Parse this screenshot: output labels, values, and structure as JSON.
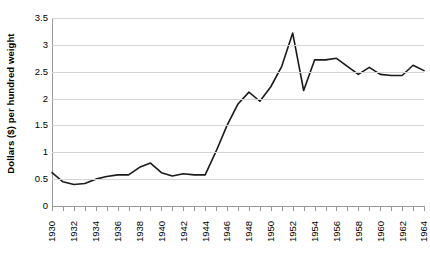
{
  "chart_data": {
    "type": "line",
    "title": "",
    "subtitle": "",
    "xlabel": "",
    "ylabel": "Dollars ($) per hundred weight",
    "ylim": [
      0,
      3.5
    ],
    "xlim": [
      1930,
      1964
    ],
    "y_ticks": [
      0,
      0.5,
      1,
      1.5,
      2,
      2.5,
      3,
      3.5
    ],
    "y_tick_labels": [
      "0",
      "0.5",
      "1",
      "1.5",
      "2",
      "2.5",
      "3",
      "3.5"
    ],
    "x_ticks": [
      1930,
      1932,
      1934,
      1936,
      1938,
      1940,
      1942,
      1944,
      1946,
      1948,
      1950,
      1952,
      1954,
      1956,
      1958,
      1960,
      1962,
      1964
    ],
    "x_tick_labels": [
      "1930",
      "1932",
      "1934",
      "1936",
      "1938",
      "1940",
      "1942",
      "1944",
      "1946",
      "1948",
      "1950",
      "1952",
      "1954",
      "1956",
      "1958",
      "1960",
      "1962",
      "1964"
    ],
    "x_minor_tick_step": 1,
    "grid": "horizontal",
    "legend": "none",
    "line_color": "#1a1a1a",
    "line_width": 1.6,
    "markers": "none",
    "x": [
      1930,
      1931,
      1932,
      1933,
      1934,
      1935,
      1936,
      1937,
      1938,
      1939,
      1940,
      1941,
      1942,
      1943,
      1944,
      1945,
      1946,
      1947,
      1948,
      1949,
      1950,
      1951,
      1952,
      1953,
      1954,
      1955,
      1956,
      1957,
      1958,
      1959,
      1960,
      1961,
      1962,
      1963,
      1964
    ],
    "values": [
      0.62,
      0.45,
      0.4,
      0.42,
      0.5,
      0.55,
      0.58,
      0.58,
      0.72,
      0.8,
      0.62,
      0.56,
      0.6,
      0.58,
      0.58,
      1.02,
      1.5,
      1.9,
      2.12,
      1.95,
      2.22,
      2.6,
      3.22,
      2.15,
      2.72,
      2.72,
      2.75,
      2.6,
      2.45,
      2.58,
      2.45,
      2.43,
      2.43,
      2.62,
      2.52
    ],
    "series": [
      {
        "name": "price",
        "points": [
          {
            "year": 1930,
            "value": 0.62
          },
          {
            "year": 1931,
            "value": 0.45
          },
          {
            "year": 1932,
            "value": 0.4
          },
          {
            "year": 1933,
            "value": 0.42
          },
          {
            "year": 1934,
            "value": 0.5
          },
          {
            "year": 1935,
            "value": 0.55
          },
          {
            "year": 1936,
            "value": 0.58
          },
          {
            "year": 1937,
            "value": 0.58
          },
          {
            "year": 1938,
            "value": 0.72
          },
          {
            "year": 1939,
            "value": 0.8
          },
          {
            "year": 1940,
            "value": 0.62
          },
          {
            "year": 1941,
            "value": 0.56
          },
          {
            "year": 1942,
            "value": 0.6
          },
          {
            "year": 1943,
            "value": 0.58
          },
          {
            "year": 1944,
            "value": 0.58
          },
          {
            "year": 1945,
            "value": 1.02
          },
          {
            "year": 1946,
            "value": 1.5
          },
          {
            "year": 1947,
            "value": 1.9
          },
          {
            "year": 1948,
            "value": 2.12
          },
          {
            "year": 1949,
            "value": 1.95
          },
          {
            "year": 1950,
            "value": 2.22
          },
          {
            "year": 1951,
            "value": 2.6
          },
          {
            "year": 1952,
            "value": 3.22
          },
          {
            "year": 1953,
            "value": 2.15
          },
          {
            "year": 1954,
            "value": 2.72
          },
          {
            "year": 1955,
            "value": 2.72
          },
          {
            "year": 1956,
            "value": 2.75
          },
          {
            "year": 1957,
            "value": 2.6
          },
          {
            "year": 1958,
            "value": 2.45
          },
          {
            "year": 1959,
            "value": 2.58
          },
          {
            "year": 1960,
            "value": 2.45
          },
          {
            "year": 1961,
            "value": 2.43
          },
          {
            "year": 1962,
            "value": 2.43
          },
          {
            "year": 1963,
            "value": 2.62
          },
          {
            "year": 1964,
            "value": 2.52
          }
        ]
      }
    ]
  }
}
